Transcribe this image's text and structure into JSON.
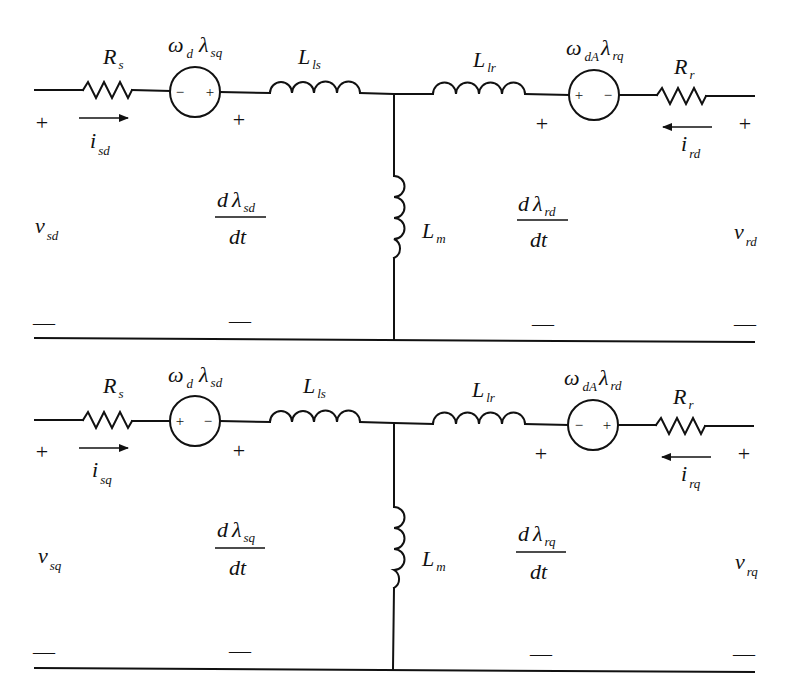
{
  "diagram": {
    "colors": {
      "line": "#111111",
      "background": "#ffffff"
    },
    "circuits": [
      {
        "axis": "d",
        "stator_voltage": {
          "main": "v",
          "sub": "sd"
        },
        "stator_current": {
          "main": "i",
          "sub": "sd",
          "direction": "right"
        },
        "stator_resistor": {
          "main": "R",
          "sub": "s"
        },
        "stator_source": {
          "main": "ω",
          "sub1": "d",
          "main2": "λ",
          "sub2": "sq",
          "left_sign": "−",
          "right_sign": "+"
        },
        "stator_leakage": {
          "main": "L",
          "sub": "ls"
        },
        "stator_emf": {
          "num_d": "d",
          "num_lambda": "λ",
          "num_sub": "sd",
          "den": "dt"
        },
        "magnetizing": {
          "main": "L",
          "sub": "m"
        },
        "rotor_leakage": {
          "main": "L",
          "sub": "lr"
        },
        "rotor_source": {
          "main": "ω",
          "sub1": "dA",
          "main2": "λ",
          "sub2": "rq",
          "left_sign": "+",
          "right_sign": "−"
        },
        "rotor_resistor": {
          "main": "R",
          "sub": "r"
        },
        "rotor_emf": {
          "num_d": "d",
          "num_lambda": "λ",
          "num_sub": "rd",
          "den": "dt"
        },
        "rotor_current": {
          "main": "i",
          "sub": "rd",
          "direction": "left"
        },
        "rotor_voltage": {
          "main": "v",
          "sub": "rd"
        },
        "plus": "+",
        "minus": "—"
      },
      {
        "axis": "q",
        "stator_voltage": {
          "main": "v",
          "sub": "sq"
        },
        "stator_current": {
          "main": "i",
          "sub": "sq",
          "direction": "right"
        },
        "stator_resistor": {
          "main": "R",
          "sub": "s"
        },
        "stator_source": {
          "main": "ω",
          "sub1": "d",
          "main2": "λ",
          "sub2": "sd",
          "left_sign": "+",
          "right_sign": "−"
        },
        "stator_leakage": {
          "main": "L",
          "sub": "ls"
        },
        "stator_emf": {
          "num_d": "d",
          "num_lambda": "λ",
          "num_sub": "sq",
          "den": "dt"
        },
        "magnetizing": {
          "main": "L",
          "sub": "m"
        },
        "rotor_leakage": {
          "main": "L",
          "sub": "lr"
        },
        "rotor_source": {
          "main": "ω",
          "sub1": "dA",
          "main2": "λ",
          "sub2": "rd",
          "left_sign": "−",
          "right_sign": "+"
        },
        "rotor_resistor": {
          "main": "R",
          "sub": "r"
        },
        "rotor_emf": {
          "num_d": "d",
          "num_lambda": "λ",
          "num_sub": "rq",
          "den": "dt"
        },
        "rotor_current": {
          "main": "i",
          "sub": "rq",
          "direction": "left"
        },
        "rotor_voltage": {
          "main": "v",
          "sub": "rq"
        },
        "plus": "+",
        "minus": "—"
      }
    ]
  }
}
